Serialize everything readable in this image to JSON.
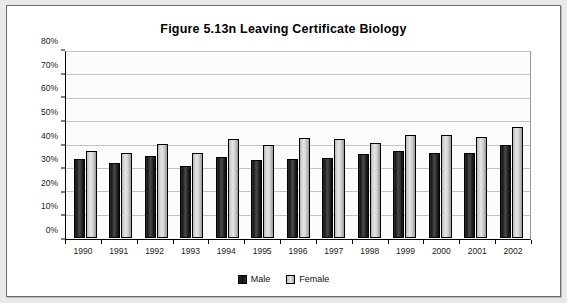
{
  "figure": {
    "title": "Figure 5.13n  Leaving Certificate Biology"
  },
  "legend": {
    "items": [
      {
        "label": "Male",
        "swatch": "male"
      },
      {
        "label": "Female",
        "swatch": "female"
      }
    ]
  },
  "chart_data": {
    "type": "bar",
    "title": "Figure 5.13n  Leaving Certificate Biology",
    "xlabel": "",
    "ylabel": "",
    "ylim": [
      0,
      80
    ],
    "ytick_labels": [
      "0%",
      "10%",
      "20%",
      "30%",
      "40%",
      "50%",
      "60%",
      "70%",
      "80%"
    ],
    "ytick_values": [
      0,
      10,
      20,
      30,
      40,
      50,
      60,
      70,
      80
    ],
    "grid": true,
    "legend_position": "bottom-center",
    "value_unit": "%",
    "categories": [
      "1990",
      "1991",
      "1992",
      "1993",
      "1994",
      "1995",
      "1996",
      "1997",
      "1998",
      "1999",
      "2000",
      "2001",
      "2002"
    ],
    "series": [
      {
        "name": "Male",
        "color": "#1a1a1a",
        "values": [
          34,
          32.5,
          35.5,
          31,
          35,
          33.5,
          34,
          34.5,
          36,
          37.5,
          36.5,
          36.5,
          40
        ]
      },
      {
        "name": "Female",
        "color": "#d6d6d6",
        "values": [
          37.5,
          36.5,
          40.5,
          36.5,
          42.5,
          40,
          43,
          42.5,
          41,
          44.5,
          44.5,
          43.5,
          48
        ]
      }
    ]
  }
}
